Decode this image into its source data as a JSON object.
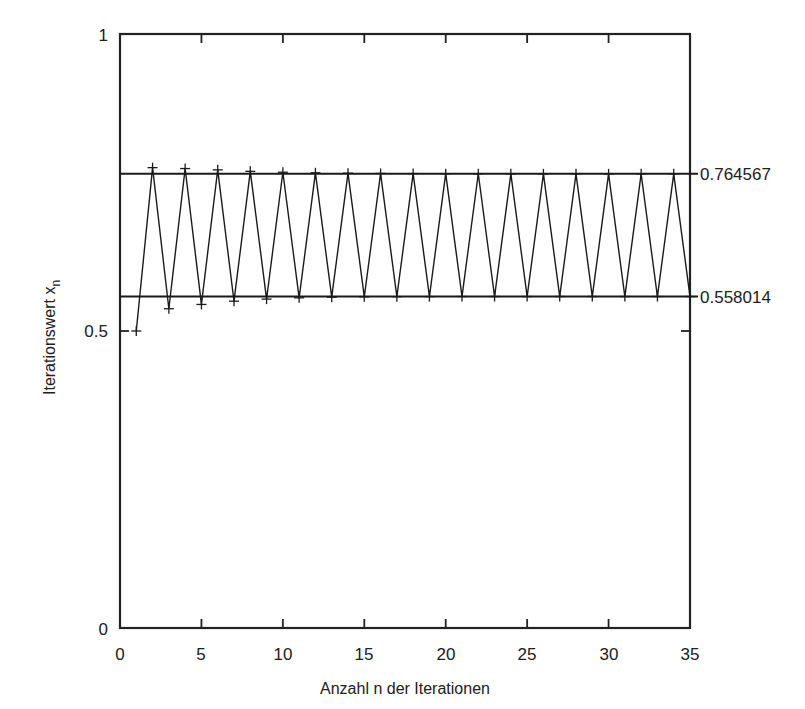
{
  "chart_data": {
    "type": "line",
    "title": "",
    "subtitle": "",
    "xlabel": "Anzahl n der Iterationen",
    "ylabel": "Iterationswert x",
    "ylabel_subscript": "n",
    "xlim": [
      0,
      35
    ],
    "ylim": [
      0,
      1
    ],
    "xticks": [
      0,
      5,
      10,
      15,
      20,
      25,
      30,
      35
    ],
    "xticklabels": [
      "0",
      "5",
      "10",
      "15",
      "20",
      "25",
      "30",
      "35"
    ],
    "yticks": [
      0,
      0.5,
      1
    ],
    "yticklabels": [
      "0",
      "0.5",
      "1"
    ],
    "grid": false,
    "legend": null,
    "marker": "plus",
    "line_color": "#1a1a1a",
    "reference_lines": [
      {
        "value": 0.764567,
        "label": "0.764567",
        "label_position": "right"
      },
      {
        "value": 0.558014,
        "label": "0.558014",
        "label_position": "right"
      }
    ],
    "x": [
      1,
      2,
      3,
      4,
      5,
      6,
      7,
      8,
      9,
      10,
      11,
      12,
      13,
      14,
      15,
      16,
      17,
      18,
      19,
      20,
      21,
      22,
      23,
      24,
      25,
      26,
      27,
      28,
      29,
      30,
      31,
      32,
      33,
      34,
      35
    ],
    "values": [
      0.5,
      0.775,
      0.5375,
      0.7735,
      0.5447,
      0.7713,
      0.5502,
      0.7688,
      0.5537,
      0.7673,
      0.5558,
      0.7663,
      0.5569,
      0.7657,
      0.5575,
      0.7653,
      0.5578,
      0.765,
      0.5579,
      0.7648,
      0.558,
      0.7647,
      0.558,
      0.7646,
      0.558,
      0.7646,
      0.558,
      0.7646,
      0.558,
      0.7646,
      0.558,
      0.7646,
      0.558,
      0.7646,
      0.558
    ],
    "series": [
      {
        "name": "x_n",
        "values": [
          0.5,
          0.775,
          0.5375,
          0.7735,
          0.5447,
          0.7713,
          0.5502,
          0.7688,
          0.5537,
          0.7673,
          0.5558,
          0.7663,
          0.5569,
          0.7657,
          0.5575,
          0.7653,
          0.5578,
          0.765,
          0.5579,
          0.7648,
          0.558,
          0.7647,
          0.558,
          0.7646,
          0.558,
          0.7646,
          0.558,
          0.7646,
          0.558,
          0.7646,
          0.558,
          0.7646,
          0.558,
          0.7646,
          0.558
        ]
      }
    ]
  },
  "axes": {
    "x_title": "Anzahl n der Iterationen",
    "y_title_main": "Iterationswert x",
    "y_title_sub": "n",
    "x_tick_0": "0",
    "x_tick_5": "5",
    "x_tick_10": "10",
    "x_tick_15": "15",
    "x_tick_20": "20",
    "x_tick_25": "25",
    "x_tick_30": "30",
    "x_tick_35": "35",
    "y_tick_0": "0",
    "y_tick_05": "0.5",
    "y_tick_1": "1"
  },
  "annotations": {
    "upper_level": "0.764567",
    "lower_level": "0.558014"
  },
  "colors": {
    "background": "#ffffff",
    "foreground": "#1a1a1a",
    "axis": "#222222"
  }
}
